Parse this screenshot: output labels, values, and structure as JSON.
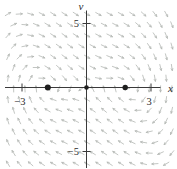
{
  "figure": {
    "background": "#ffffff",
    "axis_color": "#3a3a3a",
    "arrow_color": "#b3b6b3",
    "dot_color": "#1f1f1f",
    "label_color": "#2b2b2b",
    "x_axis": {
      "label": "x",
      "axis_px": {
        "y": 87.5,
        "x1": 5,
        "x2": 160.5
      }
    },
    "v_axis": {
      "label": "v",
      "axis_px": {
        "x": 86.5,
        "y1": 10.5,
        "y2": 168
      }
    },
    "plot": {
      "origin_px": {
        "x": 86.5,
        "y": 87.5
      },
      "px_per_unit": {
        "x": 21.5,
        "y": 12.8
      },
      "tick_half_len_px": 4
    }
  },
  "chart_data": {
    "type": "quiver",
    "xlabel": "x",
    "ylabel": "v",
    "xlim": [
      -3.8,
      4.2
    ],
    "ylim": [
      -6.2,
      6.1
    ],
    "grid": false,
    "x_ticks": [
      {
        "value": -3,
        "label": "−3"
      },
      {
        "value": 3,
        "label": "3"
      }
    ],
    "v_ticks": [
      {
        "value": 5,
        "label": "5"
      },
      {
        "value": -5,
        "label": "−5"
      }
    ],
    "field": {
      "dx_dt": "v",
      "dv_dt": "x − x³/3.24 − v",
      "coefficients": {
        "x": 1,
        "x3": -0.3086,
        "v": -1
      }
    },
    "equilibrium_points": [
      {
        "x": -1.8,
        "v": 0,
        "r_px": 3.0
      },
      {
        "x": 0,
        "v": 0,
        "r_px": 2.3
      },
      {
        "x": 1.8,
        "v": 0,
        "r_px": 2.7
      }
    ],
    "arrow_grid": {
      "x0": 8,
      "y0": 14,
      "col_step": 11.3,
      "row_step": 10.7,
      "row_offset": 5.65,
      "x_max": 173,
      "y_max": 167,
      "arrow_len_px": 6.2,
      "head_len_px": 2.1,
      "head_angle_deg": 26,
      "stroke_width": 0.8
    }
  }
}
